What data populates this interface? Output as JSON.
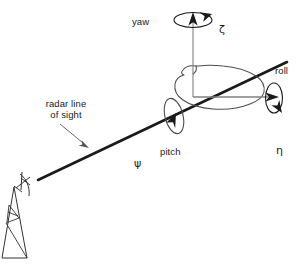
{
  "figure": {
    "width": 301,
    "height": 267,
    "background_color": "#ffffff",
    "line_color": "#1a1a1a",
    "body_outline_color": "#4d4d4d",
    "axis_color": "#808080"
  },
  "labels": {
    "yaw": "yaw",
    "zeta": "ζ",
    "roll": "roll",
    "eta": "η",
    "pitch": "pitch",
    "psi": "ψ",
    "radar_line_1": "radar line",
    "radar_line_2": "of sight"
  },
  "elements": {
    "yaw_axis": "yaw-axis-arrow",
    "yaw_rotation": "yaw-rotation-ellipse",
    "roll_axis": "roll-axis-arrow",
    "roll_rotation": "roll-rotation-ellipse",
    "pitch_rotation": "pitch-rotation-ellipse",
    "target_body": "target-aircraft-outline",
    "sight_line": "radar-line-of-sight",
    "antenna": "radar-antenna-dish",
    "tower": "radar-antenna-tower",
    "callout": "radar-line-of-sight-callout-arrow"
  }
}
